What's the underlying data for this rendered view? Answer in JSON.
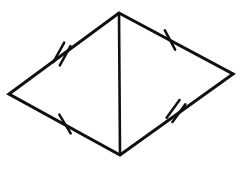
{
  "figure": {
    "kind": "geometry-diagram",
    "background_color": "#ffffff",
    "stroke_color": "#101010",
    "canvas": {
      "width": 243,
      "height": 182
    },
    "vertices": [
      {
        "name": "top",
        "label": "",
        "x": 119,
        "y": 13
      },
      {
        "name": "right",
        "label": "",
        "x": 233,
        "y": 74
      },
      {
        "name": "bottom",
        "label": "",
        "x": 120,
        "y": 155
      },
      {
        "name": "left",
        "label": "",
        "x": 9,
        "y": 94
      }
    ],
    "diagonal": {
      "name": "vertical-diagonal",
      "from": "top",
      "to": "bottom",
      "x1": 119,
      "y1": 13,
      "x2": 120,
      "y2": 155
    },
    "edges": [
      {
        "name": "upper-left-edge",
        "from": "top",
        "to": "left",
        "tick_count": 2,
        "tick_center": {
          "x": 62,
          "y": 54
        },
        "tick_angle_deg": 29
      },
      {
        "name": "upper-right-edge",
        "from": "top",
        "to": "right",
        "tick_count": 1,
        "tick_center": {
          "x": 170,
          "y": 40
        },
        "tick_angle_deg": -28
      },
      {
        "name": "lower-left-edge",
        "from": "left",
        "to": "bottom",
        "tick_count": 1,
        "tick_center": {
          "x": 65,
          "y": 124
        },
        "tick_angle_deg": -31
      },
      {
        "name": "lower-right-edge",
        "from": "bottom",
        "to": "right",
        "tick_count": 2,
        "tick_center": {
          "x": 176,
          "y": 111
        },
        "tick_angle_deg": 36
      }
    ],
    "tick_geometry": {
      "half_length": 11,
      "double_offset": 3.6
    },
    "caption": ""
  }
}
